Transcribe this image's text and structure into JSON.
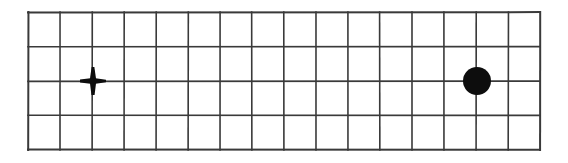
{
  "canvas": {
    "width": 568,
    "height": 163,
    "background_color": "#ffffff"
  },
  "grid": {
    "label": "graph-paper-grid",
    "x": 28,
    "y": 12,
    "width": 512,
    "height": 138,
    "columns": 16,
    "rows": 4,
    "cell_width": 32,
    "cell_height": 34.5,
    "line_color": "#3a3a3a",
    "line_width": 1.6,
    "outer_line_width": 2.0,
    "fill_color": "#ffffff",
    "column_x": [
      28,
      60,
      92,
      124,
      156,
      188,
      220,
      252,
      284,
      316,
      348,
      380,
      412,
      444,
      476,
      508,
      540
    ],
    "row_y": [
      12,
      46.5,
      81,
      115.5,
      150
    ]
  },
  "markers": [
    {
      "name": "plus-marker",
      "shape": "plus",
      "cx": 93,
      "cy": 81,
      "grid_col": 2,
      "grid_row": 2,
      "half_width": 13,
      "half_height": 14,
      "stroke": 5.2,
      "color": "#0d0d0d"
    },
    {
      "name": "dot-marker",
      "shape": "filled-circle",
      "cx": 477,
      "cy": 81,
      "grid_col": 14,
      "grid_row": 2,
      "radius": 14,
      "color": "#0d0d0d"
    }
  ],
  "chart_data": {
    "type": "scatter",
    "title": "",
    "xlabel": "",
    "ylabel": "",
    "grid": true,
    "legend": "none",
    "xlim": [
      0,
      16
    ],
    "ylim": [
      0,
      4
    ],
    "xticks": [
      0,
      1,
      2,
      3,
      4,
      5,
      6,
      7,
      8,
      9,
      10,
      11,
      12,
      13,
      14,
      15,
      16
    ],
    "yticks": [
      0,
      1,
      2,
      3,
      4
    ],
    "xtick_labels": [],
    "ytick_labels": [],
    "series": [
      {
        "name": "plus-point",
        "marker": "plus",
        "color": "#0d0d0d",
        "x": [
          2
        ],
        "y": [
          2
        ]
      },
      {
        "name": "dot-point",
        "marker": "filled-circle",
        "color": "#0d0d0d",
        "x": [
          14
        ],
        "y": [
          2
        ]
      }
    ]
  }
}
